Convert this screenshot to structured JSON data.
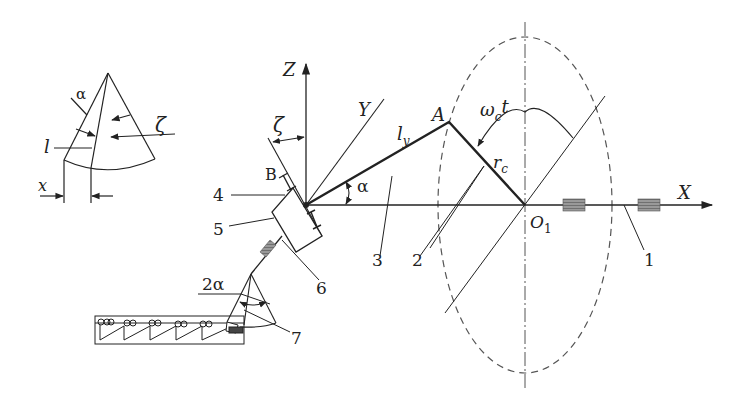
{
  "diagram": {
    "type": "kinematic-scheme",
    "colors": {
      "line": "#222222",
      "dashed": "#555555",
      "bearing": "#888888",
      "background": "#ffffff"
    },
    "axes": {
      "x": {
        "label": "X"
      },
      "y": {
        "label": "Y"
      },
      "z": {
        "label": "Z"
      }
    },
    "points": {
      "origin": "O",
      "center": "O",
      "center_sub": "1",
      "a": "A",
      "b": "B"
    },
    "symbols": {
      "link_l": "l",
      "link_l_sub": "y",
      "radius_r": "r",
      "radius_sub": "c",
      "omega": "ω",
      "omega_sub": "c",
      "omega_t": "t",
      "alpha": "α",
      "zeta": "ζ",
      "two_alpha": "2α"
    },
    "callouts": [
      "1",
      "2",
      "3",
      "4",
      "5",
      "6",
      "7"
    ],
    "inset": {
      "alpha": "α",
      "zeta": "ζ",
      "l": "l",
      "x": "x"
    }
  }
}
